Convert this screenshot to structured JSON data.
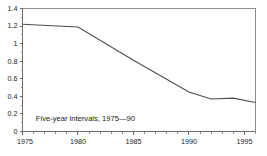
{
  "chart_data": {
    "type": "line",
    "title": "",
    "subtitle": "",
    "xlabel": "",
    "ylabel": "",
    "xlim": [
      1975,
      1996
    ],
    "ylim": [
      0,
      1.4
    ],
    "grid": false,
    "legend": null,
    "legend_position": "none",
    "annotations": [
      {
        "name": "interval-note",
        "text": "Five-year intervals, 1975—90",
        "x": 1976.2,
        "y": 0.14
      }
    ],
    "y_ticks": [
      0,
      0.2,
      0.4,
      0.6,
      0.8,
      1,
      1.2,
      1.4
    ],
    "y_tick_labels": [
      "0",
      "0.2",
      "0.4",
      "0.6",
      "0.8",
      "1",
      "1.2",
      "1.4"
    ],
    "y_minor_ticks": [
      0.1,
      0.3,
      0.5,
      0.7,
      0.9,
      1.1,
      1.3
    ],
    "x_ticks": [
      1975,
      1980,
      1985,
      1990,
      1995
    ],
    "x_tick_labels": [
      "1975",
      "1980",
      "1985",
      "1990",
      "1995"
    ],
    "x_minor_ticks": [
      1976,
      1977,
      1978,
      1979,
      1981,
      1982,
      1983,
      1984,
      1986,
      1987,
      1988,
      1989,
      1991,
      1992,
      1993,
      1994,
      1996
    ],
    "series": [
      {
        "name": "series-1",
        "color": "#4d4d4d",
        "x": [
          1975,
          1980,
          1985,
          1990,
          1992,
          1994,
          1996
        ],
        "values": [
          1.22,
          1.19,
          0.81,
          0.45,
          0.37,
          0.38,
          0.33
        ]
      }
    ]
  },
  "colors": {
    "line": "#4d4d4d",
    "axis": "#6b6b6b",
    "text": "#1a1a1a",
    "background": "#ffffff"
  }
}
